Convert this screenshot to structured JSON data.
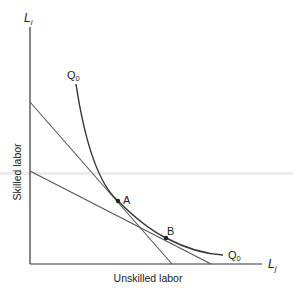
{
  "diagram": {
    "type": "isoquant-isocost",
    "y_axis": {
      "label": "L",
      "subscript": "i",
      "title": "Skilled labor"
    },
    "x_axis": {
      "label": "L",
      "subscript": "j",
      "title": "Unskilled labor"
    },
    "curve": {
      "name": "Q",
      "subscript": "0",
      "label_top": "Q0",
      "label_bottom": "Q0"
    },
    "points": [
      {
        "name": "A",
        "x": 118,
        "y": 201
      },
      {
        "name": "B",
        "x": 166,
        "y": 238
      }
    ],
    "lines": [
      {
        "name": "steep-isocost",
        "from": [
          30,
          102
        ],
        "to": [
          172,
          264
        ]
      },
      {
        "name": "shallow-isocost",
        "from": [
          30,
          171
        ],
        "to": [
          211,
          264
        ]
      }
    ],
    "colors": {
      "axis": "#333333",
      "curve": "#333333",
      "lines": "#555555"
    }
  }
}
